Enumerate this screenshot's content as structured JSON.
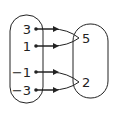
{
  "diagram": {
    "type": "mapping",
    "domain": [
      "3",
      "1",
      "−1",
      "−3"
    ],
    "range": [
      "5",
      "2"
    ],
    "mappings": [
      {
        "from": "3",
        "to": "5"
      },
      {
        "from": "1",
        "to": "5"
      },
      {
        "from": "−1",
        "to": "2"
      },
      {
        "from": "−3",
        "to": "2"
      }
    ],
    "colors": {
      "stroke": "#222222",
      "background": "#ffffff"
    }
  }
}
